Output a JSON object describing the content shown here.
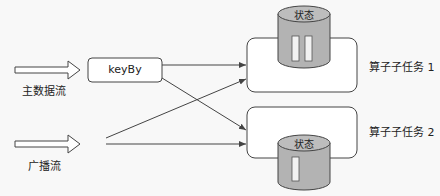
{
  "diagram": {
    "inputs": [
      {
        "id": "main",
        "label": "主数据流"
      },
      {
        "id": "broadcast",
        "label": "广播流"
      }
    ],
    "keyby": {
      "label": "keyBy"
    },
    "tasks": [
      {
        "label": "算子子任务 1",
        "state_label": "状态",
        "state_slots": 2
      },
      {
        "label": "算子子任务 2",
        "state_label": "状态",
        "state_slots": 1
      }
    ],
    "colors": {
      "stroke": "#444444",
      "cylinder_fill": "#b3b3b3",
      "slot_fill": "#f2f2f2",
      "background": "#f8f8f8"
    }
  }
}
